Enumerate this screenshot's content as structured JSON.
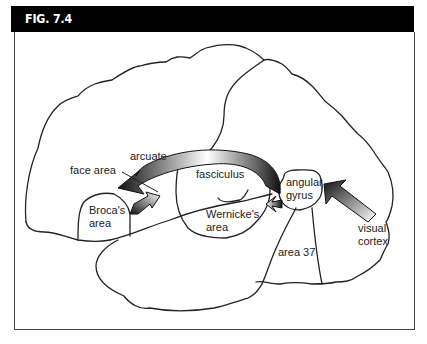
{
  "figure": {
    "label": "FIG. 7.4"
  },
  "labels": {
    "face_area": "face area",
    "arcuate": "arcuate",
    "fasciculus": "fasciculus",
    "angular": "angular",
    "gyrus": "gyrus",
    "brocas": "Broca's",
    "brocas_area": "area",
    "wernickes": "Wernicke's",
    "wernickes_area": "area",
    "area37": "area 37",
    "visual": "visual",
    "cortex": "cortex"
  },
  "colors": {
    "header_bg": "#000000",
    "header_text": "#ffffff",
    "outline": "#222222",
    "arrow_dark": "#111111",
    "arrow_light": "#ffffff"
  }
}
